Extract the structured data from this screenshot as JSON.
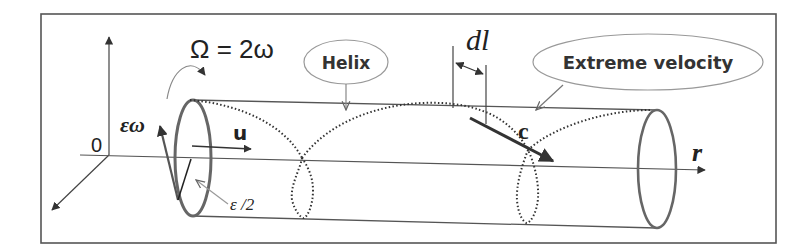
{
  "diagram": {
    "title": "",
    "labels": {
      "omega_eq": "Ω = 2ω",
      "eps_omega": "εω",
      "origin": "0",
      "u": "u",
      "eps_half": "ε /2",
      "helix": "Helix",
      "dl": "dl",
      "extreme_velocity": "Extreme velocity",
      "c": "c",
      "r": "r"
    },
    "colors": {
      "frame": "#555555",
      "stroke": "#444444",
      "ellipse": "#666666",
      "dotted": "#333333",
      "axis": "#444444",
      "callout": "#888888",
      "text": "#222222"
    },
    "nodes": [
      {
        "id": "left-ring",
        "type": "ellipse",
        "label": ""
      },
      {
        "id": "right-ring",
        "type": "ellipse",
        "label": ""
      },
      {
        "id": "helix-callout",
        "type": "ellipse",
        "label": "Helix"
      },
      {
        "id": "extreme-velocity-callout",
        "type": "ellipse",
        "label": "Extreme velocity"
      }
    ],
    "edges": [
      {
        "from": "helix-callout",
        "to": "helix-curve",
        "type": "arrow"
      },
      {
        "from": "extreme-velocity-callout",
        "to": "cylinder-top",
        "type": "arrow"
      }
    ]
  }
}
